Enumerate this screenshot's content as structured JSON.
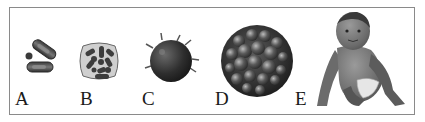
{
  "figure": {
    "panels": [
      {
        "label": "A",
        "subject": "bacteria-cells",
        "description": "small rod-shaped cells and a round cell"
      },
      {
        "label": "B",
        "subject": "cell-with-organelles",
        "description": "rounded cell filled with rod-shaped inclusions"
      },
      {
        "label": "C",
        "subject": "spiky-cell",
        "description": "dark spherical cell with spikes"
      },
      {
        "label": "D",
        "subject": "multicellular-ball",
        "description": "large textured sphere of many cells"
      },
      {
        "label": "E",
        "subject": "baby",
        "description": "crawling baby in a diaper"
      }
    ]
  },
  "colors": {
    "frame": "#8a8a8a",
    "ink": "#1a1a1a",
    "background": "#ffffff"
  }
}
